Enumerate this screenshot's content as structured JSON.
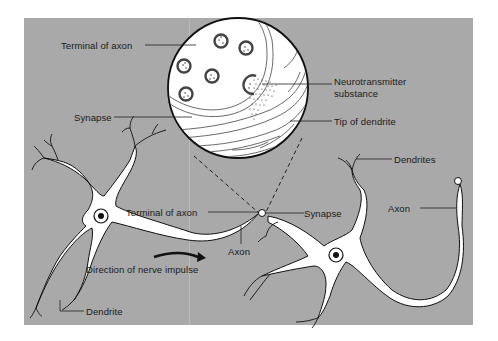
{
  "diagram": {
    "colors": {
      "background": "#ffffff",
      "panel": "#a9a9a9",
      "cell": "#ffffff",
      "outline": "#111111"
    },
    "labels": {
      "terminal_of_axon_top": "Terminal of axon",
      "synapse_left": "Synapse",
      "neurotransmitter_line1": "Neurotransmitter",
      "neurotransmitter_line2": "substance",
      "tip_of_dendrite": "Tip of dendrite",
      "dendrites": "Dendrites",
      "terminal_of_axon_mid": "Terminal of axon",
      "synapse_mid": "Synapse",
      "axon_right": "Axon",
      "axon_mid": "Axon",
      "direction_of_impulse": "Direction of nerve impulse",
      "dendrite_bottom": "Dendrite"
    }
  }
}
